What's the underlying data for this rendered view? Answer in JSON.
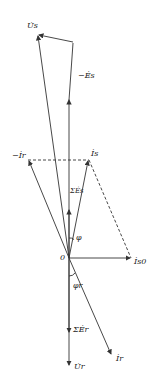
{
  "diagram": {
    "type": "phasor-diagram",
    "origin_label": "0",
    "colors": {
      "line": "#333333",
      "background": "#ffffff"
    },
    "labels": {
      "Us": "U̇s",
      "neg_Es": "−Ės",
      "neg_Ir": "−İr",
      "Is": "İs",
      "sum_Es": "ΣĖs",
      "phi": "φ",
      "phi_r": "φr",
      "Is0": "İs0",
      "sum_Er": "ΣĖr",
      "Ur": "U̇r",
      "Ir": "İr"
    },
    "phasors": [
      {
        "name": "Us",
        "from": [
          69,
          258
        ],
        "to": [
          38,
          35
        ]
      },
      {
        "name": "neg_Es",
        "from": [
          69,
          258
        ],
        "to": [
          73,
          42
        ]
      },
      {
        "name": "neg_Ir",
        "from": [
          69,
          258
        ],
        "to": [
          28,
          160
        ]
      },
      {
        "name": "Is",
        "from": [
          69,
          258
        ],
        "to": [
          89,
          160
        ]
      },
      {
        "name": "Is0",
        "from": [
          69,
          258
        ],
        "to": [
          131,
          258
        ]
      },
      {
        "name": "Ur",
        "from": [
          69,
          258
        ],
        "to": [
          69,
          366
        ]
      },
      {
        "name": "Ir",
        "from": [
          69,
          258
        ],
        "to": [
          112,
          355
        ]
      }
    ],
    "caption": ""
  }
}
